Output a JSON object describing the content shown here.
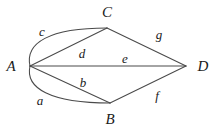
{
  "diagram": {
    "type": "multigraph",
    "title": "",
    "background_color": "#ffffff",
    "stroke_color": "#4a4a4a",
    "text_color": "#1a1a1a",
    "vertices": [
      {
        "id": "A",
        "label": "A",
        "x": 30,
        "y": 66,
        "label_x": 11,
        "label_y": 66
      },
      {
        "id": "B",
        "label": "B",
        "x": 110,
        "y": 103,
        "label_x": 110,
        "label_y": 119
      },
      {
        "id": "C",
        "label": "C",
        "x": 107,
        "y": 28,
        "label_x": 107,
        "label_y": 12
      },
      {
        "id": "D",
        "label": "D",
        "x": 186,
        "y": 66,
        "label_x": 203,
        "label_y": 66
      }
    ],
    "edges": [
      {
        "id": "a",
        "label": "a",
        "from": "A",
        "to": "B",
        "shape": "curve",
        "label_x": 40,
        "label_y": 100
      },
      {
        "id": "b",
        "label": "b",
        "from": "A",
        "to": "B",
        "shape": "line",
        "label_x": 83,
        "label_y": 82
      },
      {
        "id": "c",
        "label": "c",
        "from": "A",
        "to": "C",
        "shape": "curve",
        "label_x": 42,
        "label_y": 31
      },
      {
        "id": "d",
        "label": "d",
        "from": "A",
        "to": "C",
        "shape": "line",
        "label_x": 82,
        "label_y": 53
      },
      {
        "id": "e",
        "label": "e",
        "from": "A",
        "to": "D",
        "shape": "line",
        "label_x": 125,
        "label_y": 58
      },
      {
        "id": "f",
        "label": "f",
        "from": "B",
        "to": "D",
        "shape": "line",
        "label_x": 157,
        "label_y": 95
      },
      {
        "id": "g",
        "label": "g",
        "from": "C",
        "to": "D",
        "shape": "line",
        "label_x": 159,
        "label_y": 34
      }
    ],
    "paths": {
      "a": "M 30 66 C 25 88 50 103 110 103",
      "b": "M 30 66 L 110 103",
      "c": "M 30 66 C 25 43 49 28 107 28",
      "d": "M 30 66 L 107 28",
      "e": "M 30 66 L 186 66",
      "f": "M 110 103 L 186 66",
      "g": "M 107 28 L 186 66"
    }
  }
}
